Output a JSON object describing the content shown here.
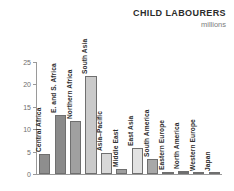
{
  "chart_data": {
    "type": "bar",
    "title": "CHILD LABOURERS",
    "subtitle": "millions",
    "xlabel": "",
    "ylabel": "millions",
    "ylim": [
      0,
      25
    ],
    "yticks": [
      0,
      5,
      10,
      15,
      20,
      25
    ],
    "grid": false,
    "legend": false,
    "categories": [
      "Central Africa",
      "E. and S. Africa",
      "Northern Africa",
      "South Asia",
      "Asia–Pacific",
      "Middle East",
      "East Asia",
      "South America",
      "Eastern Europe",
      "North America",
      "Western Europe",
      "Japan"
    ],
    "values": [
      4.4,
      13.1,
      11.8,
      21.8,
      4.6,
      1.2,
      5.7,
      3.4,
      0.4,
      0.6,
      0.1,
      0.05
    ],
    "bar_colors": [
      "#8e8e8e",
      "#8a8a8a",
      "#a0a0a0",
      "#cacaca",
      "#d8d8d8",
      "#9e9e9e",
      "#e2e2e2",
      "#a8a8a8",
      "#c4c4c4",
      "#6e6e6e",
      "#e8e8e8",
      "#efefef"
    ]
  },
  "colors": {
    "background": "#ffffff",
    "axis": "#9a9a9a",
    "tick_text": "#6e6e6e",
    "label_text": "#2f2f2f",
    "title_text": "#2b2b2b",
    "subtitle_text": "#7d7d7d"
  }
}
